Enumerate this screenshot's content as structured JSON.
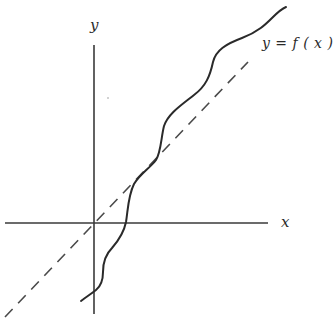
{
  "diagram": {
    "type": "function-graph",
    "axes": {
      "x_label": "x",
      "y_label": "y",
      "color": "#3a3a3a"
    },
    "curve": {
      "label": "y = f ( x )",
      "color": "#2a2a2a",
      "description": "wavy increasing curve that crosses the dashed diagonal line and stays mostly above it"
    },
    "reference_line": {
      "style": "dashed",
      "description": "diagonal line through the origin (y = x)",
      "color": "#4a4a4a"
    }
  }
}
